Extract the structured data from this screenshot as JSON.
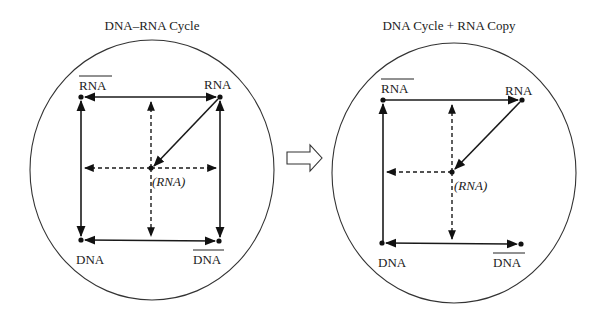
{
  "left_panel": {
    "title": "DNA–RNA Cycle",
    "labels": {
      "top_left": "RNA",
      "top_left_overbar": true,
      "top_right": "RNA",
      "bottom_left": "DNA",
      "bottom_right": "DNA",
      "bottom_right_overbar": true,
      "center": "(RNA)"
    }
  },
  "right_panel": {
    "title": "DNA Cycle + RNA Copy",
    "labels": {
      "top_left": "RNA",
      "top_left_overbar": true,
      "top_right": "RNA",
      "bottom_left": "DNA",
      "bottom_right": "DNA",
      "bottom_right_overbar": true,
      "center": "(RNA)"
    }
  },
  "transition_arrow": {
    "icon": "hollow-right-arrow-icon"
  },
  "colors": {
    "ink": "#1a1a1a",
    "background": "#ffffff"
  }
}
